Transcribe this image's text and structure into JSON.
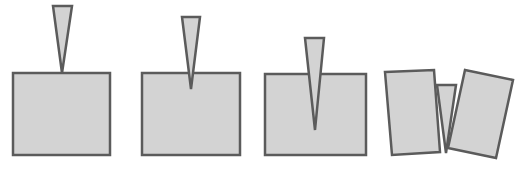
{
  "diagram": {
    "colors": {
      "fill": "#d3d3d3",
      "stroke": "#5b5b5b",
      "background": "#ffffff"
    },
    "stroke_width": 2.5,
    "panels": [
      {
        "id": "stage-1",
        "description": "Wedge tip touching top of block",
        "block": [
          [
            13,
            73
          ],
          [
            110,
            73
          ],
          [
            110,
            155
          ],
          [
            13,
            155
          ]
        ],
        "wedge": [
          [
            53,
            6
          ],
          [
            72,
            6
          ],
          [
            62,
            73
          ]
        ]
      },
      {
        "id": "stage-2",
        "description": "Wedge beginning to penetrate block",
        "block": [
          [
            142,
            73
          ],
          [
            240,
            73
          ],
          [
            240,
            155
          ],
          [
            142,
            155
          ]
        ],
        "wedge": [
          [
            182,
            17
          ],
          [
            200,
            17
          ],
          [
            191,
            89
          ]
        ]
      },
      {
        "id": "stage-3",
        "description": "Wedge driven deep, crack forming",
        "block": [
          [
            265,
            74
          ],
          [
            366,
            74
          ],
          [
            366,
            155
          ],
          [
            265,
            155
          ]
        ],
        "wedge": [
          [
            305,
            38
          ],
          [
            324,
            38
          ],
          [
            315,
            130
          ]
        ],
        "crack": [
          [
            315,
            74
          ],
          [
            315,
            130
          ]
        ]
      },
      {
        "id": "stage-4",
        "description": "Block split into two pieces by wedge",
        "left_piece": [
          [
            385,
            72
          ],
          [
            434,
            70
          ],
          [
            440,
            152
          ],
          [
            392,
            155
          ]
        ],
        "right_piece": [
          [
            465,
            70
          ],
          [
            513,
            80
          ],
          [
            496,
            158
          ],
          [
            448,
            148
          ]
        ],
        "wedge": [
          [
            437,
            85
          ],
          [
            456,
            85
          ],
          [
            446,
            153
          ]
        ]
      }
    ]
  }
}
